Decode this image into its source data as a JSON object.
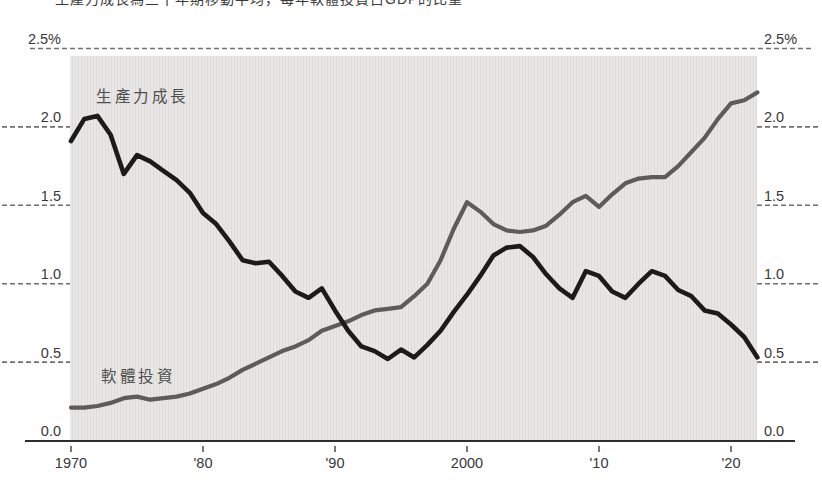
{
  "title": {
    "text": "生產力成長為三十年期移動平均，每年軟體投資占GDP的比重"
  },
  "chart_data": {
    "type": "line",
    "title": "生產力成長為三十年期移動平均，每年軟體投資占GDP的比重",
    "unit": "%",
    "xlim": [
      1970,
      2022
    ],
    "ylim": [
      0,
      2.5
    ],
    "x": [
      1970,
      1971,
      1972,
      1973,
      1974,
      1975,
      1976,
      1977,
      1978,
      1979,
      1980,
      1981,
      1982,
      1983,
      1984,
      1985,
      1986,
      1987,
      1988,
      1989,
      1990,
      1991,
      1992,
      1993,
      1994,
      1995,
      1996,
      1997,
      1998,
      1999,
      2000,
      2001,
      2002,
      2003,
      2004,
      2005,
      2006,
      2007,
      2008,
      2009,
      2010,
      2011,
      2012,
      2013,
      2014,
      2015,
      2016,
      2017,
      2018,
      2019,
      2020,
      2021,
      2022
    ],
    "series": [
      {
        "name": "生產力成長",
        "color": "#1b1b1b",
        "stroke_width": 4.6,
        "values": [
          1.91,
          2.05,
          2.07,
          1.95,
          1.7,
          1.82,
          1.78,
          1.72,
          1.66,
          1.58,
          1.45,
          1.38,
          1.27,
          1.15,
          1.13,
          1.14,
          1.05,
          0.95,
          0.91,
          0.97,
          0.83,
          0.7,
          0.6,
          0.57,
          0.52,
          0.58,
          0.53,
          0.61,
          0.7,
          0.82,
          0.93,
          1.05,
          1.18,
          1.23,
          1.24,
          1.17,
          1.06,
          0.97,
          0.91,
          1.08,
          1.05,
          0.95,
          0.91,
          1.0,
          1.08,
          1.05,
          0.96,
          0.92,
          0.83,
          0.81,
          0.74,
          0.66,
          0.53
        ]
      },
      {
        "name": "軟體投資",
        "color": "#5c5c5c",
        "stroke_width": 4.2,
        "values": [
          0.21,
          0.21,
          0.22,
          0.24,
          0.27,
          0.28,
          0.26,
          0.27,
          0.28,
          0.3,
          0.33,
          0.36,
          0.4,
          0.45,
          0.49,
          0.53,
          0.57,
          0.6,
          0.64,
          0.7,
          0.73,
          0.76,
          0.8,
          0.83,
          0.84,
          0.85,
          0.92,
          1.0,
          1.15,
          1.35,
          1.52,
          1.46,
          1.38,
          1.34,
          1.33,
          1.34,
          1.37,
          1.44,
          1.52,
          1.56,
          1.49,
          1.57,
          1.64,
          1.67,
          1.68,
          1.68,
          1.75,
          1.84,
          1.93,
          2.05,
          2.15,
          2.17,
          2.22
        ]
      }
    ],
    "xticks": {
      "values": [
        1970,
        1980,
        1990,
        2000,
        2010,
        2020
      ],
      "labels": [
        "1970",
        "'80",
        "'90",
        "2000",
        "'10",
        "'20"
      ]
    },
    "yticks": {
      "values": [
        2.5,
        2.0,
        1.5,
        1.0,
        0.5,
        0.0
      ],
      "labels_left": [
        "2.5%",
        "2.0",
        "1.5",
        "1.0",
        "0.5",
        "0.0"
      ],
      "labels_right": [
        "2.5%",
        "2.0",
        "1.5",
        "1.0",
        "0.5",
        "0.0"
      ]
    },
    "grid": {
      "full_dashed_at": 2.5,
      "stub_dashed_at": [
        2.0,
        1.5,
        1.0,
        0.5
      ]
    },
    "colors": {
      "band": "#e4e3e1",
      "grid": "#6f6f6f",
      "axis": "#2e2e2e",
      "text": "#383838"
    },
    "legend_position": "inline-labels"
  }
}
